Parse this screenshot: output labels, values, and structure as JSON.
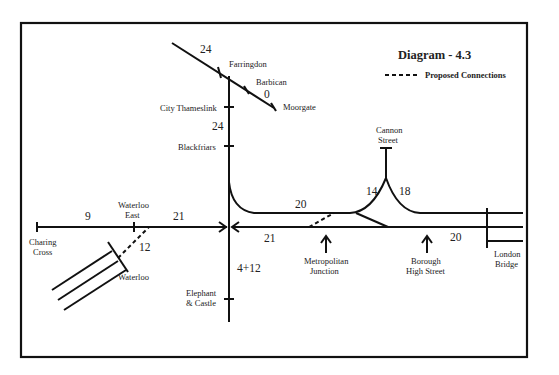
{
  "diagram": {
    "title": "Diagram - 4.3",
    "legend": {
      "proposed_connections": "Proposed Connections"
    },
    "stations": {
      "farringdon": "Farringdon",
      "barbican": "Barbican",
      "moorgate": "Moorgate",
      "city_thameslink": "City Thameslink",
      "blackfriars": "Blackfriars",
      "cannon_street_1": "Cannon",
      "cannon_street_2": "Street",
      "charing_cross_1": "Charing",
      "charing_cross_2": "Cross",
      "waterloo_east_1": "Waterloo",
      "waterloo_east_2": "East",
      "waterloo": "Waterloo",
      "elephant_castle_1": "Elephant",
      "elephant_castle_2": "& Castle",
      "metropolitan_junction_1": "Metropolitan",
      "metropolitan_junction_2": "Junction",
      "borough_high_street_1": "Borough",
      "borough_high_street_2": "High Street",
      "london_bridge_1": "London",
      "london_bridge_2": "Bridge"
    },
    "segment_values": {
      "farringdon_north": "24",
      "barbican_moorgate": "0",
      "thameslink_blackfriars": "24",
      "charing_waterloo_east": "9",
      "waterloo_east_junction": "21",
      "waterloo_link": "12",
      "upper_line": "20",
      "lower_line": "21",
      "cannon_west": "14",
      "cannon_east": "18",
      "london_bridge_approach": "20",
      "elephant_castle": "4+12"
    }
  }
}
